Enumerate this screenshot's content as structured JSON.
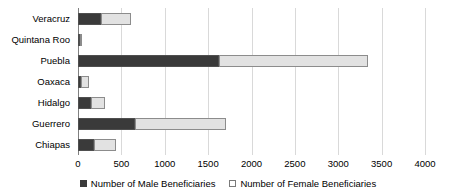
{
  "chart_data": {
    "type": "bar",
    "subtype": "stacked-horizontal-bar",
    "title": "",
    "xlabel": "",
    "ylabel": "",
    "xlim": [
      0,
      4000
    ],
    "xticks": [
      0,
      500,
      1000,
      1500,
      2000,
      2500,
      3000,
      3500,
      4000
    ],
    "xtick_labels": [
      "0",
      "500",
      "1000",
      "1500",
      "2000",
      "2500",
      "3000",
      "3500",
      "4000"
    ],
    "grid": true,
    "grid_axis": "x",
    "legend_position": "bottom",
    "orientation": "horizontal",
    "categories": [
      "Veracruz",
      "Quintana Roo",
      "Puebla",
      "Oaxaca",
      "Hidalgo",
      "Guerrero",
      "Chiapas"
    ],
    "series": [
      {
        "name": "Number of Male Beneficiaries",
        "color": "#3a3a3a",
        "values": [
          265,
          25,
          1625,
          40,
          150,
          655,
          185
        ]
      },
      {
        "name": "Number of Female Beneficiaries",
        "color": "#e2e2e2",
        "values": [
          345,
          25,
          1720,
          90,
          160,
          1050,
          255
        ]
      }
    ],
    "totals": [
      610,
      50,
      3345,
      130,
      310,
      1705,
      440
    ]
  },
  "legend": {
    "items": [
      {
        "label": "Number of Male Beneficiaries",
        "marker": "filled-square-icon"
      },
      {
        "label": "Number of Female Beneficiaries",
        "marker": "hollow-square-icon"
      }
    ]
  },
  "colors": {
    "male": "#3a3a3a",
    "female": "#e2e2e2",
    "gridline": "#d9d9d9",
    "axis": "#808080",
    "text": "#000000",
    "background": "#ffffff"
  }
}
